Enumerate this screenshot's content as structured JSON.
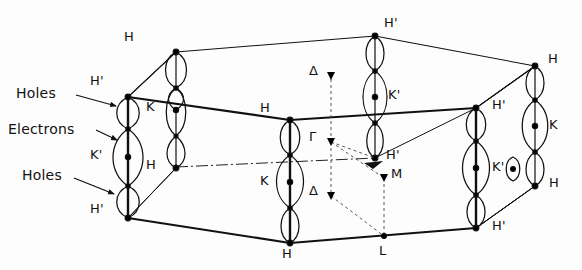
{
  "figure": {
    "type": "brillouin-zone-diagram",
    "colors": {
      "line": "#111111",
      "background": "#ffffff",
      "pocket_outline": "#111111",
      "center_dot": "#000000"
    },
    "annotations": [
      {
        "id": "ann-holes-top",
        "label": "Holes",
        "x": 16,
        "y": 92,
        "arrow_to_x": 120,
        "arrow_to_y": 105
      },
      {
        "id": "ann-electrons",
        "label": "Electrons",
        "x": 8,
        "y": 127,
        "arrow_to_x": 120,
        "arrow_to_y": 140
      },
      {
        "id": "ann-holes-bottom",
        "label": "Holes",
        "x": 22,
        "y": 174,
        "arrow_to_x": 120,
        "arrow_to_y": 192
      }
    ],
    "vertex_labels": [
      {
        "id": "v-h-backleft",
        "text": "H",
        "x": 124,
        "y": 30
      },
      {
        "id": "v-hp-backcenter",
        "text": "H'",
        "x": 384,
        "y": 20
      },
      {
        "id": "v-h-backright",
        "text": "H",
        "x": 548,
        "y": 55
      },
      {
        "id": "v-hp-frontleft-t",
        "text": "H'",
        "x": 92,
        "y": 78
      },
      {
        "id": "v-k-innerleft",
        "text": "K",
        "x": 147,
        "y": 103
      },
      {
        "id": "v-kp-backcenter",
        "text": "K'",
        "x": 388,
        "y": 90
      },
      {
        "id": "v-h-midcenter",
        "text": "H",
        "x": 261,
        "y": 104
      },
      {
        "id": "v-hp-frontright",
        "text": "H'",
        "x": 492,
        "y": 101
      },
      {
        "id": "v-k-farright",
        "text": "K",
        "x": 549,
        "y": 127
      },
      {
        "id": "v-kp-frontleft",
        "text": "K'",
        "x": 92,
        "y": 152
      },
      {
        "id": "v-hp-innerright",
        "text": "H'",
        "x": 386,
        "y": 151
      },
      {
        "id": "v-h-innerleft",
        "text": "H",
        "x": 147,
        "y": 162
      },
      {
        "id": "v-k-frontcenter",
        "text": "K",
        "x": 261,
        "y": 178
      },
      {
        "id": "v-kp-frontright",
        "text": "K'",
        "x": 492,
        "y": 163
      },
      {
        "id": "v-h-farright-bot",
        "text": "H",
        "x": 549,
        "y": 180
      },
      {
        "id": "v-hp-frontleft-b",
        "text": "H'",
        "x": 92,
        "y": 205
      },
      {
        "id": "v-hp-frontright-b",
        "text": "H'",
        "x": 492,
        "y": 222
      },
      {
        "id": "v-h-frontbottom",
        "text": "H",
        "x": 282,
        "y": 250
      }
    ],
    "symmetry_points": [
      {
        "id": "sym-delta-top",
        "text": "Δ",
        "label_x": 311,
        "label_y": 71,
        "dot_x": 331,
        "dot_y": 76
      },
      {
        "id": "sym-gamma",
        "text": "Γ",
        "label_x": 311,
        "label_y": 135,
        "dot_x": 331,
        "dot_y": 142
      },
      {
        "id": "sym-m",
        "text": "M",
        "label_x": 393,
        "label_y": 177,
        "dot_x": 384,
        "dot_y": 178
      },
      {
        "id": "sym-delta-bottom",
        "text": "Δ",
        "label_x": 311,
        "label_y": 190,
        "dot_x": 331,
        "dot_y": 196
      },
      {
        "id": "sym-l",
        "text": "L",
        "label_x": 380,
        "label_y": 248,
        "dot_x": 384,
        "dot_y": 236
      }
    ],
    "columns": [
      {
        "id": "col-front-left",
        "x": 128,
        "top_y": 97,
        "bottom_y": 218,
        "kind": "hole-electron-hole"
      },
      {
        "id": "col-inner-left",
        "x": 176,
        "top_y": 110,
        "bottom_y": 168,
        "kind": "hole-electron"
      },
      {
        "id": "col-back-left",
        "x": 176,
        "top_y": 52,
        "bottom_y": 88,
        "kind": "hole"
      },
      {
        "id": "col-center-front",
        "x": 290,
        "top_y": 120,
        "bottom_y": 243,
        "kind": "hole-electron-hole"
      },
      {
        "id": "col-back-center",
        "x": 375,
        "top_y": 36,
        "bottom_y": 158,
        "kind": "hole-electron-hole"
      },
      {
        "id": "col-front-right",
        "x": 476,
        "top_y": 108,
        "bottom_y": 228,
        "kind": "hole-electron-hole"
      },
      {
        "id": "col-far-right",
        "x": 535,
        "top_y": 66,
        "bottom_y": 186,
        "kind": "hole-electron-hole"
      }
    ]
  }
}
